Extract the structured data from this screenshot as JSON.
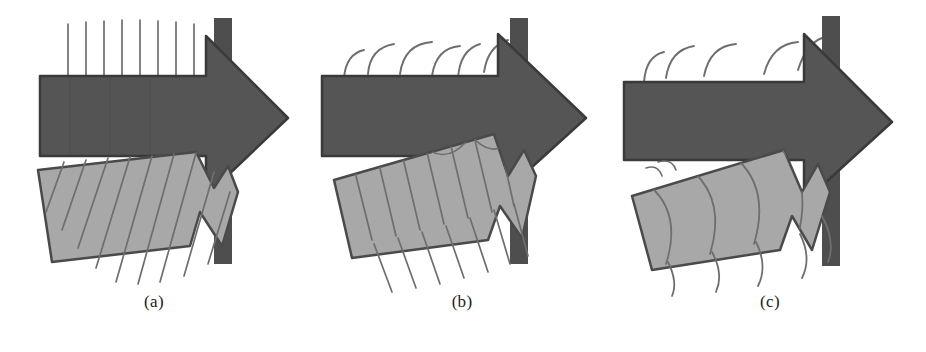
{
  "figure": {
    "type": "diagram",
    "background_color": "#ffffff",
    "panel_count": 3
  },
  "colors": {
    "dark_arrow_fill": "#555555",
    "dark_arrow_stroke": "#3a3a3a",
    "light_arrow_fill": "#a8a8a8",
    "light_arrow_stroke": "#4a4a4a",
    "bar_fill": "#4e4e4e",
    "wavefront_stroke": "#6e6e6e",
    "caption_color": "#1a1a1a"
  },
  "panels": [
    {
      "id": "a",
      "caption": "(a)",
      "incident_arrow": {
        "name": "dark-horizontal-arrow",
        "color": "#555555",
        "direction": "right",
        "angle_deg": 0
      },
      "secondary_arrow": {
        "name": "light-tilted-arrow",
        "color": "#a8a8a8",
        "angle_deg": 10,
        "label": "refracted beam"
      },
      "boundary_bar": {
        "name": "vertical-boundary-bar",
        "color": "#4e4e4e",
        "orientation": "vertical"
      },
      "wavefronts": {
        "incident": {
          "shape": "straight",
          "curvature": 0,
          "count": 8,
          "orientation": "vertical"
        },
        "transmitted": {
          "shape": "straight",
          "curvature": 0,
          "count": 9,
          "tilt_deg": 16
        }
      }
    },
    {
      "id": "b",
      "caption": "(b)",
      "incident_arrow": {
        "name": "dark-horizontal-arrow",
        "color": "#555555",
        "direction": "right",
        "angle_deg": 0
      },
      "secondary_arrow": {
        "name": "light-tilted-arrow",
        "color": "#a8a8a8",
        "angle_deg": 18,
        "label": "refracted beam"
      },
      "boundary_bar": {
        "name": "vertical-boundary-bar",
        "color": "#4e4e4e",
        "orientation": "vertical"
      },
      "wavefronts": {
        "incident": {
          "shape": "curved",
          "curvature": 0.45,
          "count": 6,
          "orientation": "arc"
        },
        "transmitted": {
          "shape": "slightly-curved",
          "curvature": 0.2,
          "count": 9,
          "tilt_deg": 24
        }
      }
    },
    {
      "id": "c",
      "caption": "(c)",
      "incident_arrow": {
        "name": "dark-horizontal-arrow",
        "color": "#555555",
        "direction": "right",
        "angle_deg": 0
      },
      "secondary_arrow": {
        "name": "light-tilted-arrow",
        "color": "#a8a8a8",
        "angle_deg": 25,
        "label": "refracted beam"
      },
      "boundary_bar": {
        "name": "vertical-boundary-bar",
        "color": "#4e4e4e",
        "orientation": "vertical"
      },
      "wavefronts": {
        "incident": {
          "shape": "curved",
          "curvature": 0.5,
          "count": 5,
          "orientation": "arc"
        },
        "transmitted": {
          "shape": "strongly-curved",
          "curvature": 0.75,
          "count": 6,
          "tilt_deg": 30
        }
      }
    }
  ]
}
